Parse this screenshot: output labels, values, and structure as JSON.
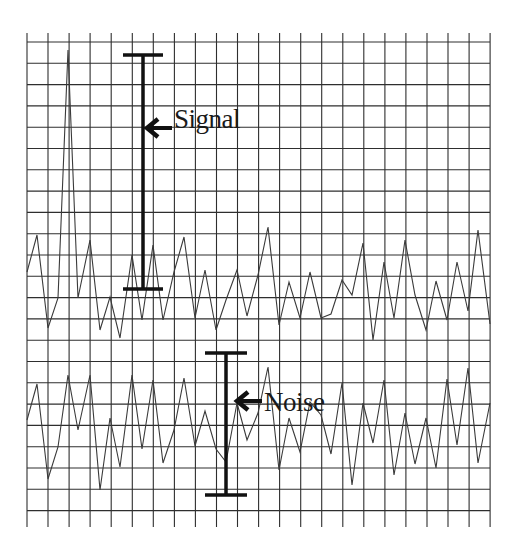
{
  "diagram": {
    "grid": {
      "x_start": 27,
      "x_end": 490,
      "x_step": 21.05,
      "y_start": 42,
      "y_end": 520,
      "y_step": 21.3,
      "color": "#333333"
    },
    "signal_label": "Signal",
    "noise_label": "Noise",
    "signal_bar": {
      "x": 143,
      "y_top": 55,
      "y_bottom": 289,
      "cap_half_width": 20
    },
    "noise_bar": {
      "x": 226,
      "y_top": 353,
      "y_bottom": 495,
      "cap_half_width": 21
    },
    "signal_trace": [
      [
        27,
        272
      ],
      [
        37,
        235
      ],
      [
        48,
        328
      ],
      [
        58,
        298
      ],
      [
        68,
        50
      ],
      [
        78,
        298
      ],
      [
        90,
        240
      ],
      [
        100,
        330
      ],
      [
        110,
        297
      ],
      [
        120,
        338
      ],
      [
        132,
        255
      ],
      [
        142,
        320
      ],
      [
        153,
        245
      ],
      [
        163,
        320
      ],
      [
        174,
        272
      ],
      [
        184,
        237
      ],
      [
        195,
        318
      ],
      [
        205,
        270
      ],
      [
        216,
        330
      ],
      [
        226,
        300
      ],
      [
        237,
        270
      ],
      [
        247,
        316
      ],
      [
        258,
        275
      ],
      [
        268,
        227
      ],
      [
        279,
        325
      ],
      [
        289,
        282
      ],
      [
        300,
        318
      ],
      [
        310,
        272
      ],
      [
        321,
        318
      ],
      [
        331,
        314
      ],
      [
        342,
        280
      ],
      [
        352,
        295
      ],
      [
        363,
        243
      ],
      [
        373,
        340
      ],
      [
        384,
        262
      ],
      [
        394,
        318
      ],
      [
        405,
        240
      ],
      [
        415,
        295
      ],
      [
        426,
        330
      ],
      [
        436,
        281
      ],
      [
        447,
        320
      ],
      [
        457,
        262
      ],
      [
        468,
        311
      ],
      [
        478,
        230
      ],
      [
        490,
        324
      ],
      [
        500,
        280
      ]
    ],
    "noise_trace": [
      [
        27,
        420
      ],
      [
        37,
        384
      ],
      [
        48,
        479
      ],
      [
        58,
        447
      ],
      [
        68,
        375
      ],
      [
        78,
        430
      ],
      [
        90,
        375
      ],
      [
        100,
        490
      ],
      [
        110,
        418
      ],
      [
        120,
        467
      ],
      [
        132,
        375
      ],
      [
        142,
        449
      ],
      [
        153,
        380
      ],
      [
        163,
        463
      ],
      [
        174,
        430
      ],
      [
        184,
        378
      ],
      [
        195,
        446
      ],
      [
        205,
        411
      ],
      [
        216,
        449
      ],
      [
        226,
        462
      ],
      [
        237,
        403
      ],
      [
        247,
        440
      ],
      [
        258,
        413
      ],
      [
        268,
        367
      ],
      [
        279,
        470
      ],
      [
        289,
        418
      ],
      [
        300,
        452
      ],
      [
        310,
        402
      ],
      [
        321,
        415
      ],
      [
        331,
        454
      ],
      [
        342,
        383
      ],
      [
        352,
        485
      ],
      [
        363,
        403
      ],
      [
        373,
        443
      ],
      [
        384,
        380
      ],
      [
        394,
        475
      ],
      [
        405,
        413
      ],
      [
        415,
        464
      ],
      [
        426,
        418
      ],
      [
        436,
        468
      ],
      [
        447,
        379
      ],
      [
        457,
        445
      ],
      [
        468,
        368
      ],
      [
        478,
        463
      ],
      [
        490,
        403
      ],
      [
        500,
        455
      ]
    ]
  }
}
